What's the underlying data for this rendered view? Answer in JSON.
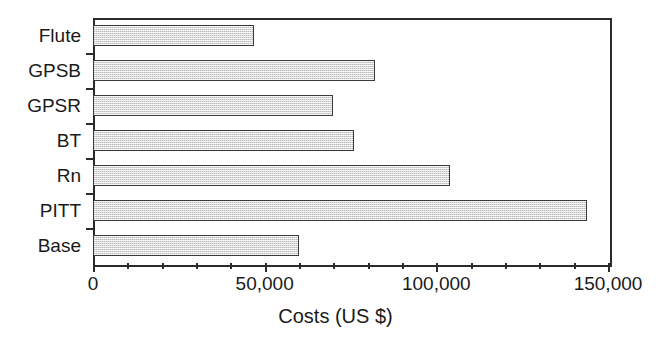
{
  "chart_data": {
    "type": "bar",
    "orientation": "horizontal",
    "title": "",
    "xlabel": "Costs (US $)",
    "ylabel": "",
    "categories": [
      "Base",
      "PITT",
      "Rn",
      "BT",
      "GPSR",
      "GPSB",
      "Flute"
    ],
    "values": [
      60000,
      144000,
      104000,
      76000,
      70000,
      82000,
      47000
    ],
    "xlim": [
      0,
      150000
    ],
    "xticks": [
      0,
      50000,
      100000,
      150000
    ],
    "xtick_labels": [
      "0",
      "50,000",
      "100,000",
      "150,000"
    ],
    "xminor_tick_step": 10000,
    "grid": false,
    "legend": null,
    "bar_fill_color": "#d6d6d6",
    "bar_edge_color": "#3a3a3a",
    "axis_color": "#2b2b2b",
    "background_color": "#ffffff"
  },
  "axis": {
    "x_title": "Costs (US $)",
    "tick_labels": [
      "0",
      "50,000",
      "100,000",
      "150,000"
    ]
  },
  "bars": [
    {
      "label": "Flute",
      "value": 47000
    },
    {
      "label": "GPSB",
      "value": 82000
    },
    {
      "label": "GPSR",
      "value": 70000
    },
    {
      "label": "BT",
      "value": 76000
    },
    {
      "label": "Rn",
      "value": 104000
    },
    {
      "label": "PITT",
      "value": 144000
    },
    {
      "label": "Base",
      "value": 60000
    }
  ]
}
